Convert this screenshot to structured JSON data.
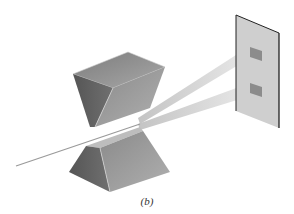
{
  "figure": {
    "caption": "(b)",
    "elements": {
      "incident_beam": "single narrow beam entering between magnets",
      "upper_magnet": "wedge-shaped pole piece (north)",
      "lower_magnet": "trough-shaped pole piece (south)",
      "split_beams": 2,
      "detector_screen": "vertical plate with two deposit spots"
    },
    "colors": {
      "magnet_dark": "#5a5a5a",
      "magnet_mid": "#8a8a8a",
      "magnet_light": "#b5b5b5",
      "beam": "#c8c8c8",
      "screen": "#cfcfcf",
      "screen_edge": "#222222",
      "spot": "#8c8c8c"
    }
  }
}
